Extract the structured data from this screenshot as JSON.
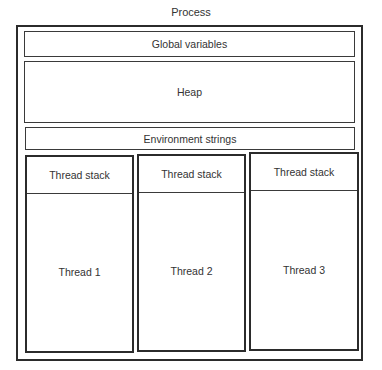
{
  "diagram": {
    "title": "Process",
    "sections": {
      "global_variables": "Global variables",
      "heap": "Heap",
      "environment_strings": "Environment strings"
    },
    "threads": [
      {
        "stack": "Thread stack",
        "label": "Thread 1"
      },
      {
        "stack": "Thread stack",
        "label": "Thread 2"
      },
      {
        "stack": "Thread stack",
        "label": "Thread 3"
      }
    ]
  }
}
